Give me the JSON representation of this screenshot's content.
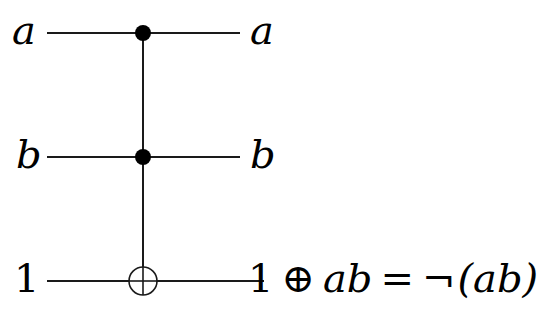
{
  "diagram": {
    "type": "quantum-circuit",
    "gate": "Toffoli (CCNOT)",
    "wires": [
      {
        "id": "a",
        "input": "a",
        "output": "a",
        "role": "control"
      },
      {
        "id": "b",
        "input": "b",
        "output": "b",
        "role": "control"
      },
      {
        "id": "target",
        "input": "1",
        "output": "1 ⊕ ab = ¬(ab)",
        "role": "target"
      }
    ],
    "output_expression": {
      "one": "1",
      "xor": "⊕",
      "ab": "ab",
      "equals": "=",
      "not": "¬",
      "paren_ab": "(ab)"
    },
    "colors": {
      "line": "#1a1a1a",
      "dot": "#000000",
      "background": "#ffffff"
    }
  }
}
